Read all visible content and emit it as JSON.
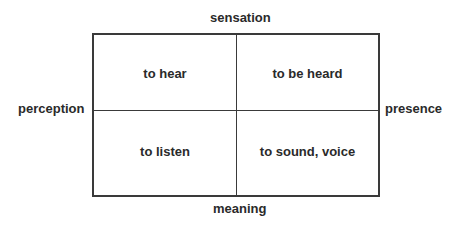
{
  "axes": {
    "top": "sensation",
    "bottom": "meaning",
    "left": "perception",
    "right": "presence"
  },
  "quadrants": {
    "top_left": "to hear",
    "top_right": "to be heard",
    "bottom_left": "to listen",
    "bottom_right": "to sound, voice"
  }
}
